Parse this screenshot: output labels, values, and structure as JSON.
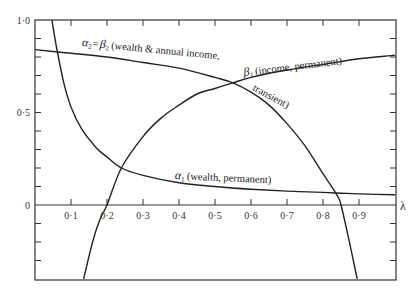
{
  "chart_data": {
    "type": "line",
    "title": "",
    "xlabel": "λ",
    "ylabel": "",
    "xlim": [
      0,
      1.0
    ],
    "ylim": [
      -0.4,
      1.0
    ],
    "grid": false,
    "x_ticks": [
      "0·1",
      "0·2",
      "0·3",
      "0·4",
      "0·5",
      "0·6",
      "0·7",
      "0·8",
      "0·9"
    ],
    "y_ticks": [
      "1·0",
      "0·5",
      "0"
    ],
    "series": [
      {
        "name": "α1 (wealth, permanent)",
        "x": [
          0.047,
          0.06,
          0.08,
          0.1,
          0.13,
          0.17,
          0.2,
          0.24,
          0.3,
          0.4,
          0.5,
          0.6,
          0.7,
          0.8,
          0.85,
          0.9,
          1.0
        ],
        "y": [
          1.0,
          0.85,
          0.66,
          0.53,
          0.41,
          0.31,
          0.26,
          0.2,
          0.16,
          0.12,
          0.1,
          0.085,
          0.075,
          0.068,
          0.064,
          0.06,
          0.055
        ]
      },
      {
        "name": "α2 = β2 (wealth & annual income, transient)",
        "x": [
          0.0,
          0.1,
          0.2,
          0.3,
          0.4,
          0.5,
          0.55,
          0.6,
          0.65,
          0.7,
          0.75,
          0.8,
          0.84,
          0.85,
          0.87,
          0.895
        ],
        "y": [
          0.84,
          0.82,
          0.8,
          0.77,
          0.74,
          0.69,
          0.66,
          0.61,
          0.54,
          0.44,
          0.32,
          0.17,
          0.05,
          0.0,
          -0.17,
          -0.4
        ]
      },
      {
        "name": "β1 (income, permanent)",
        "x": [
          0.135,
          0.16,
          0.18,
          0.2,
          0.24,
          0.3,
          0.35,
          0.4,
          0.45,
          0.5,
          0.55,
          0.6,
          0.7,
          0.8,
          0.9,
          1.0
        ],
        "y": [
          -0.4,
          -0.2,
          -0.08,
          0.0,
          0.2,
          0.37,
          0.47,
          0.54,
          0.6,
          0.63,
          0.66,
          0.69,
          0.73,
          0.76,
          0.79,
          0.81
        ]
      }
    ],
    "annotations": [
      {
        "text": "α2 = β2 (wealth & annual income,",
        "near": [
          0.14,
          0.84
        ]
      },
      {
        "text": "transient)",
        "near": [
          0.64,
          0.58
        ]
      },
      {
        "text": "β1 (income, permanent)",
        "near": [
          0.58,
          0.72
        ]
      },
      {
        "text": "α1 (wealth, permanent)",
        "near": [
          0.38,
          0.15
        ]
      }
    ]
  },
  "labels": {
    "x_axis": "λ",
    "y_top": "1·0",
    "y_mid": "0·5",
    "y_zero": "0",
    "ann_alpha2_prefix": "α",
    "ann_alpha2_sub": "2",
    "ann_alpha2_eq": "=",
    "ann_beta2": "β",
    "ann_beta2_sub": "2",
    "ann_alpha2_text": "(wealth & annual income,",
    "ann_transient": "transient)",
    "ann_beta1": "β",
    "ann_beta1_sub": "1",
    "ann_beta1_text": "(income, permanent)",
    "ann_alpha1": "α",
    "ann_alpha1_sub": "1",
    "ann_alpha1_text": "(wealth, permanent)"
  }
}
